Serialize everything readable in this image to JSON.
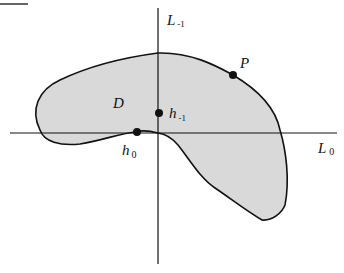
{
  "figure": {
    "width": 344,
    "height": 273,
    "colors": {
      "background": "#ffffff",
      "region_fill": "#d9d9d9",
      "stroke": "#111111"
    }
  },
  "axes": {
    "horizontal": {
      "label_main": "L",
      "label_sub": "0"
    },
    "vertical": {
      "label_main": "L",
      "label_sub": "-1"
    }
  },
  "region": {
    "label": "D"
  },
  "points": {
    "P": {
      "label_main": "P",
      "label_sub": ""
    },
    "h0": {
      "label_main": "h",
      "label_sub": "0"
    },
    "hm1": {
      "label_main": "h",
      "label_sub": "-1"
    }
  }
}
